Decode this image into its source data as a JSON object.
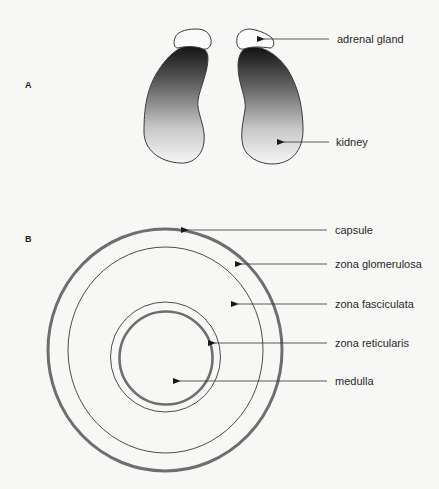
{
  "panels": {
    "a": {
      "letter": "A",
      "labels": {
        "adrenal_gland": "adrenal gland",
        "kidney": "kidney"
      }
    },
    "b": {
      "letter": "B",
      "labels": {
        "capsule": "capsule",
        "zona_glomerulosa": "zona glomerulosa",
        "zona_fasciculata": "zona fasciculata",
        "zona_reticularis": "zona reticularis",
        "medulla": "medulla"
      }
    }
  },
  "colors": {
    "background": "#f7f7f5",
    "outline": "#3a3a3a",
    "thick_ring": "#6e6e6e",
    "kidney_gradient_top": "#111111",
    "kidney_gradient_bottom": "#f4f4f4"
  }
}
